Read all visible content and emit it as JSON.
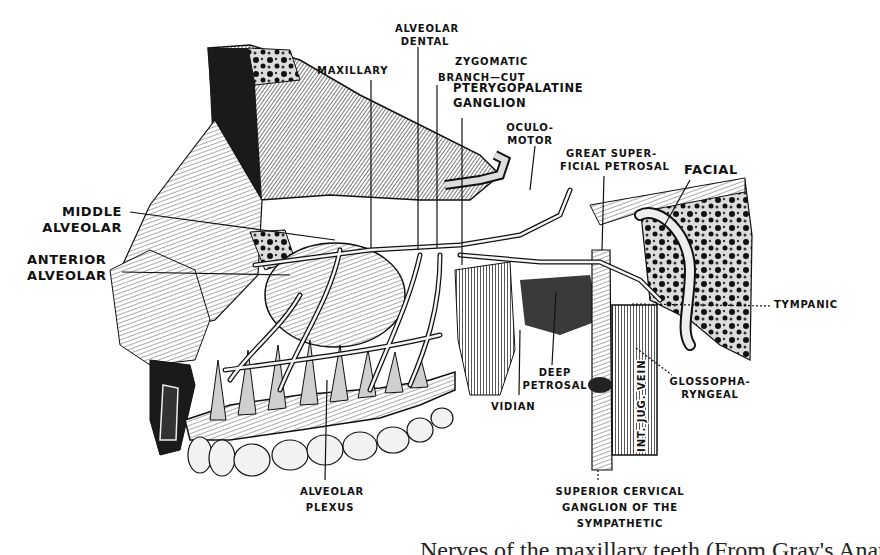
{
  "figure": {
    "type": "anatomical engraving"
  },
  "labels": {
    "alveolar_dental": [
      "ALVEOLAR",
      "DENTAL"
    ],
    "maxillary": "MAXILLARY",
    "zygomatic": "ZYGOMATIC",
    "branch_cut": "BRANCH—CUT",
    "pterygopalatine_ganglion": [
      "PTERYGOPALATINE",
      "GANGLION"
    ],
    "oculomotor": [
      "OCULO-",
      "MOTOR"
    ],
    "great_superficial_petrosal": [
      "GREAT SUPER-",
      "FICIAL PETROSAL"
    ],
    "facial": "FACIAL",
    "middle_alveolar": [
      "MIDDLE",
      "ALVEOLAR"
    ],
    "anterior_alveolar": [
      "ANTERIOR",
      "ALVEOLAR"
    ],
    "tympanic": "TYMPANIC",
    "deep_petrosal": [
      "DEEP",
      "PETROSAL"
    ],
    "vidian": "VIDIAN",
    "glossopharyngeal": [
      "GLOSSOPHA-",
      "RYNGEAL"
    ],
    "int_jug_vein": "INT. JUG. VEIN",
    "alveolar_plexus": [
      "ALVEOLAR",
      "PLEXUS"
    ],
    "superior_cervical_ganglion": [
      "SUPERIOR CERVICAL",
      "GANGLION OF THE",
      "SYMPATHETIC"
    ]
  },
  "caption": "Nerves of the maxillary teeth (From Gray's Anatomy)",
  "colors": {
    "ink": "#111111",
    "paper": "#ffffff",
    "bone_gray": "#bdbdbd",
    "shade_dark": "#2a2a2a"
  }
}
